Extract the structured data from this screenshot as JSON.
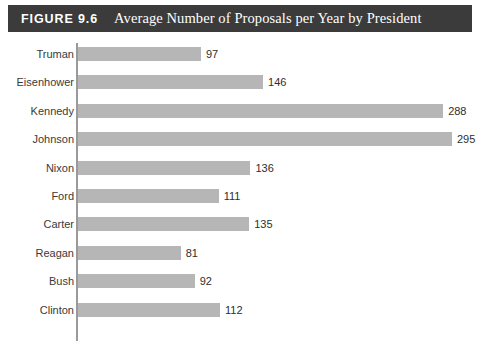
{
  "figure": {
    "label": "FIGURE 9.6",
    "title": "Average Number of Proposals per Year by President"
  },
  "colors": {
    "caption_bar": "#3b3b3b",
    "caption_text": "#ffffff",
    "bar": "#b6b6b6",
    "axis": "#9a9a9a",
    "label_text": "#3a3a3a",
    "value_text": "#2e2e2e",
    "background": "#ffffff"
  },
  "chart_data": {
    "type": "bar",
    "orientation": "horizontal",
    "title": "Average Number of Proposals per Year by President",
    "xlabel": "",
    "ylabel": "",
    "grid": false,
    "legend": "none",
    "xlim": [
      0,
      295
    ],
    "categories": [
      "Truman",
      "Eisenhower",
      "Kennedy",
      "Johnson",
      "Nixon",
      "Ford",
      "Carter",
      "Reagan",
      "Bush",
      "Clinton"
    ],
    "values": [
      97,
      146,
      288,
      295,
      136,
      111,
      135,
      81,
      92,
      112
    ],
    "data_labels": [
      "97",
      "146",
      "288",
      "295",
      "136",
      "111",
      "135",
      "81",
      "92",
      "112"
    ]
  }
}
